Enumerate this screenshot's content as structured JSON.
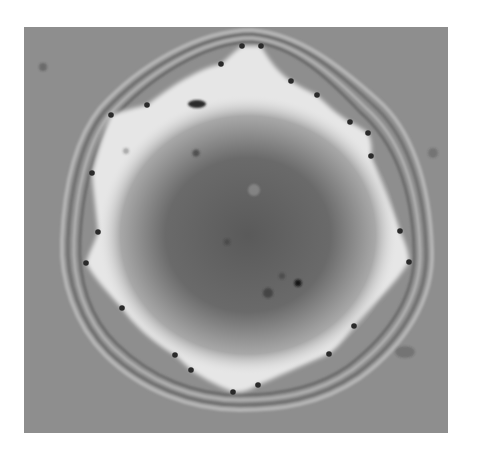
{
  "image": {
    "description": "Grayscale micrograph of a spreading film with concentric interference fringes around a lobed bright boundary; dark marker dots placed along the contact line",
    "frame": {
      "x": 24,
      "y": 27,
      "width": 424,
      "height": 406
    },
    "colors": {
      "background": "#8e8e8e",
      "bright_rim": "#e8e8e8",
      "dark_core": "#5c5c5c",
      "marker": "#2a2a2a",
      "fringe_dark": "#6e6e6e",
      "fringe_light": "#b2b2b2"
    },
    "markers": [
      [
        242,
        46
      ],
      [
        261,
        46
      ],
      [
        221,
        64
      ],
      [
        291,
        81
      ],
      [
        317,
        95
      ],
      [
        350,
        122
      ],
      [
        368,
        133
      ],
      [
        371,
        156
      ],
      [
        400,
        231
      ],
      [
        409,
        262
      ],
      [
        354,
        326
      ],
      [
        329,
        354
      ],
      [
        258,
        385
      ],
      [
        233,
        392
      ],
      [
        191,
        370
      ],
      [
        175,
        355
      ],
      [
        122,
        308
      ],
      [
        86,
        263
      ],
      [
        98,
        232
      ],
      [
        92,
        173
      ],
      [
        111,
        115
      ],
      [
        147,
        105
      ]
    ],
    "specks": [
      [
        196,
        153
      ],
      [
        200,
        104
      ],
      [
        298,
        283
      ],
      [
        268,
        293
      ],
      [
        282,
        276
      ],
      [
        227,
        242
      ],
      [
        126,
        151
      ],
      [
        43,
        67
      ],
      [
        433,
        153
      ],
      [
        405,
        352
      ]
    ]
  }
}
